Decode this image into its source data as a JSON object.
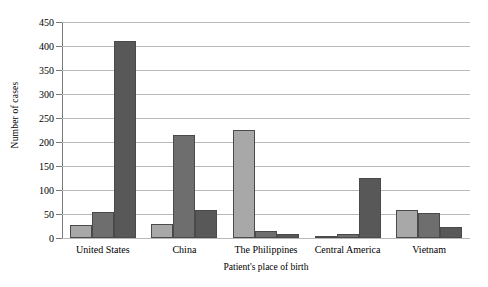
{
  "chart_data": {
    "type": "bar",
    "title": "",
    "subtitle": "",
    "xlabel": "Patient's place of birth",
    "ylabel": "Number of cases",
    "categories": [
      "United States",
      "China",
      "The Philippines",
      "Central America",
      "Vietnam"
    ],
    "series": [
      {
        "name": "series-1",
        "color": "#a8a8a8",
        "values": [
          27,
          30,
          226,
          5,
          58
        ]
      },
      {
        "name": "series-2",
        "color": "#6e6e6e",
        "values": [
          55,
          215,
          14,
          8,
          52
        ]
      },
      {
        "name": "series-3",
        "color": "#585858",
        "values": [
          410,
          59,
          9,
          125,
          22
        ]
      }
    ],
    "ylim": [
      0,
      450
    ],
    "ytick_step": 50,
    "yticks": [
      0,
      50,
      100,
      150,
      200,
      250,
      300,
      350,
      400,
      450
    ],
    "ytick_labels": [
      "0",
      "50",
      "100",
      "150",
      "200",
      "250",
      "300",
      "350",
      "400",
      "450"
    ],
    "grid": true,
    "grid_axis": "y",
    "legend": false,
    "legend_position": "none",
    "bar_border_color": "#4a4a4a",
    "axis_color": "#7a7a7a",
    "gridline_color": "#b9b9b9",
    "background": "#ffffff"
  }
}
